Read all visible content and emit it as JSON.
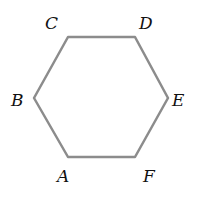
{
  "diagram": {
    "type": "regular-hexagon",
    "stroke_color": "#8c8c8c",
    "label_color": "#111111",
    "vertices": [
      {
        "name": "A",
        "x": 68,
        "y": 157,
        "lx": 57,
        "ly": 182
      },
      {
        "name": "B",
        "x": 34,
        "y": 98,
        "lx": 11,
        "ly": 106
      },
      {
        "name": "C",
        "x": 68,
        "y": 37,
        "lx": 45,
        "ly": 29
      },
      {
        "name": "D",
        "x": 135,
        "y": 37,
        "lx": 139,
        "ly": 29
      },
      {
        "name": "E",
        "x": 168,
        "y": 98,
        "lx": 172,
        "ly": 106
      },
      {
        "name": "F",
        "x": 135,
        "y": 157,
        "lx": 143,
        "ly": 182
      }
    ]
  }
}
